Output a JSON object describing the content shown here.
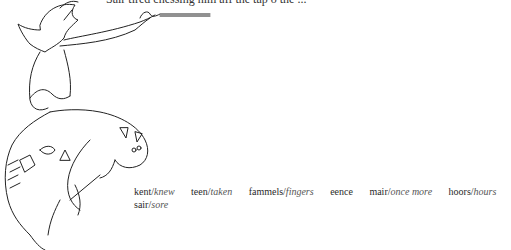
{
  "page": {
    "top_line_text": "Sair tired chessing him aff the tap o the ..."
  },
  "illustration": {
    "description": "line drawing of a goblin-like figure riding a beast, holding a long pipe/stick"
  },
  "glossary": {
    "row1": [
      {
        "scots": "kent",
        "english": "knew"
      },
      {
        "scots": "teen",
        "english": "taken"
      },
      {
        "scots": "fammels",
        "english": "fingers"
      },
      {
        "scots": "eence",
        "english": ""
      },
      {
        "scots": "mair",
        "english": "once  more"
      },
      {
        "scots": "hoors",
        "english": "hours"
      },
      {
        "scots": "tramplers",
        "english": "feet"
      }
    ],
    "row2": [
      {
        "scots": "sair",
        "english": "sore"
      }
    ]
  }
}
